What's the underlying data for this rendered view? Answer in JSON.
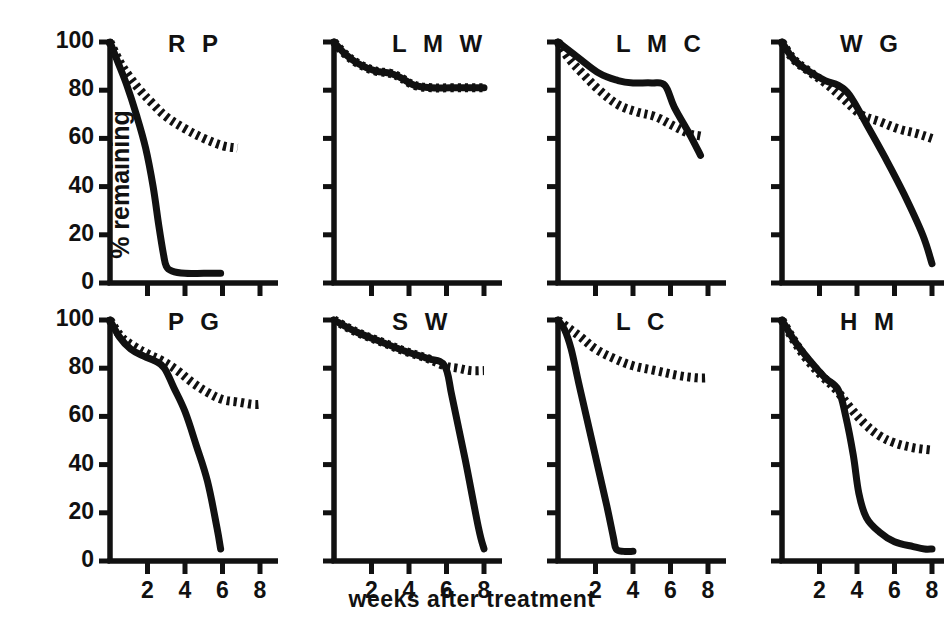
{
  "figure": {
    "ylabel": "% remaining",
    "xlabel": "weeks after treatment",
    "line_color": "#111111",
    "background": "#ffffff"
  },
  "axes": {
    "y_ticks": [
      "0",
      "20",
      "40",
      "60",
      "80",
      "100"
    ],
    "y_tick_values": [
      0,
      20,
      40,
      60,
      80,
      100
    ],
    "x_ticks": [
      "2",
      "4",
      "6",
      "8"
    ],
    "x_tick_values": [
      2,
      4,
      6,
      8
    ],
    "ylim": [
      0,
      100
    ],
    "xlim": [
      0,
      8
    ]
  },
  "chart_data": {
    "type": "line",
    "title": "",
    "xlabel": "weeks after treatment",
    "ylabel": "% remaining",
    "xlim": [
      0,
      8
    ],
    "ylim": [
      0,
      100
    ],
    "grid": false,
    "legend": "none",
    "layout": {
      "rows": 2,
      "cols": 4
    },
    "series_styles": [
      {
        "name": "solid",
        "style": "solid"
      },
      {
        "name": "hatched",
        "style": "dashed-hatched"
      }
    ],
    "panels": [
      {
        "label": "R P",
        "row": 0,
        "col": 0,
        "series": [
          {
            "name": "solid",
            "style": "solid",
            "x": [
              0,
              0.4,
              0.9,
              1.4,
              1.9,
              2.3,
              2.6,
              2.85,
              3.0,
              3.3,
              4.0,
              5.0,
              5.9
            ],
            "y": [
              100,
              92,
              82,
              70,
              56,
              40,
              24,
              12,
              7,
              5,
              4,
              4,
              4
            ]
          },
          {
            "name": "hatched",
            "style": "dashed-hatched",
            "x": [
              0,
              0.5,
              1.0,
              1.6,
              2.2,
              3.0,
              4.0,
              5.0,
              6.0,
              6.8
            ],
            "y": [
              100,
              92,
              86,
              80,
              75,
              69,
              64,
              60,
              57,
              56
            ]
          }
        ]
      },
      {
        "label": "L M W",
        "row": 0,
        "col": 1,
        "series": [
          {
            "name": "solid",
            "style": "solid",
            "x": [
              0,
              0.6,
              1.3,
              2.2,
              3.0,
              3.6,
              4.3,
              5.2,
              6.2,
              7.2,
              8.0
            ],
            "y": [
              100,
              95,
              91,
              88,
              87,
              85,
              82,
              81,
              81,
              81,
              81
            ]
          },
          {
            "name": "hatched",
            "style": "dashed-hatched",
            "x": [
              0,
              0.6,
              1.3,
              2.2,
              3.0,
              3.6,
              4.3,
              5.2,
              6.2,
              7.2,
              8.0
            ],
            "y": [
              100,
              95,
              91,
              88,
              87,
              85,
              82,
              81,
              81,
              81,
              81
            ]
          }
        ]
      },
      {
        "label": "L M C",
        "row": 0,
        "col": 2,
        "series": [
          {
            "name": "solid",
            "style": "solid",
            "x": [
              0,
              1.0,
              2.2,
              3.2,
              4.0,
              5.0,
              5.7,
              6.2,
              7.0,
              7.6
            ],
            "y": [
              100,
              94,
              87,
              84,
              83,
              83,
              82,
              73,
              62,
              53
            ]
          },
          {
            "name": "hatched",
            "style": "dashed-hatched",
            "x": [
              0,
              0.6,
              1.3,
              2.2,
              3.2,
              4.2,
              5.2,
              6.2,
              7.0,
              7.6
            ],
            "y": [
              100,
              93,
              87,
              80,
              74,
              71,
              69,
              65,
              62,
              61
            ]
          }
        ]
      },
      {
        "label": "W G",
        "row": 0,
        "col": 3,
        "series": [
          {
            "name": "solid",
            "style": "solid",
            "x": [
              0,
              0.6,
              1.4,
              2.3,
              3.0,
              3.6,
              4.5,
              5.5,
              6.5,
              7.5,
              8.0
            ],
            "y": [
              100,
              93,
              88,
              84,
              82,
              78,
              66,
              52,
              37,
              20,
              8
            ]
          },
          {
            "name": "hatched",
            "style": "dashed-hatched",
            "x": [
              0,
              0.6,
              1.4,
              2.3,
              3.2,
              4.2,
              5.2,
              6.2,
              7.2,
              8.0
            ],
            "y": [
              100,
              93,
              88,
              83,
              77,
              70,
              67,
              64,
              62,
              60
            ]
          }
        ]
      },
      {
        "label": "P G",
        "row": 1,
        "col": 0,
        "series": [
          {
            "name": "solid",
            "style": "solid",
            "x": [
              0,
              0.5,
              1.1,
              1.8,
              2.4,
              2.9,
              3.4,
              4.0,
              4.6,
              5.2,
              5.7,
              5.9
            ],
            "y": [
              100,
              93,
              88,
              85,
              83,
              80,
              72,
              62,
              48,
              33,
              14,
              5
            ]
          },
          {
            "name": "hatched",
            "style": "dashed-hatched",
            "x": [
              0,
              0.6,
              1.3,
              2.0,
              2.8,
              3.6,
              4.4,
              5.2,
              6.0,
              6.8,
              7.6,
              8.0
            ],
            "y": [
              100,
              93,
              89,
              86,
              83,
              79,
              74,
              70,
              67,
              66,
              65,
              65
            ]
          }
        ]
      },
      {
        "label": "S W",
        "row": 1,
        "col": 1,
        "series": [
          {
            "name": "solid",
            "style": "solid",
            "x": [
              0,
              1.2,
              2.5,
              3.8,
              5.0,
              5.9,
              6.3,
              7.0,
              7.7,
              8.0
            ],
            "y": [
              100,
              95,
              91,
              87,
              84,
              81,
              68,
              42,
              14,
              5
            ]
          },
          {
            "name": "hatched",
            "style": "dashed-hatched",
            "x": [
              0,
              1.2,
              2.5,
              3.8,
              5.0,
              5.9,
              6.6,
              7.3,
              8.0
            ],
            "y": [
              100,
              95,
              91,
              87,
              84,
              81,
              80,
              79,
              79
            ]
          }
        ]
      },
      {
        "label": "L C",
        "row": 1,
        "col": 2,
        "series": [
          {
            "name": "solid",
            "style": "solid",
            "x": [
              0,
              0.35,
              0.7,
              1.1,
              1.6,
              2.1,
              2.6,
              2.95,
              3.1,
              3.5,
              4.0
            ],
            "y": [
              100,
              96,
              88,
              74,
              57,
              40,
              23,
              10,
              5,
              4,
              4
            ]
          },
          {
            "name": "hatched",
            "style": "dashed-hatched",
            "x": [
              0,
              0.5,
              1.2,
              2.0,
              3.0,
              4.0,
              5.2,
              6.4,
              7.4,
              8.0
            ],
            "y": [
              100,
              97,
              93,
              88,
              84,
              81,
              79,
              77,
              76,
              76
            ]
          }
        ]
      },
      {
        "label": "H M",
        "row": 1,
        "col": 3,
        "series": [
          {
            "name": "solid",
            "style": "solid",
            "x": [
              0,
              0.7,
              1.5,
              2.3,
              3.0,
              3.4,
              3.8,
              4.1,
              4.5,
              5.2,
              6.0,
              7.0,
              7.6,
              8.0
            ],
            "y": [
              100,
              91,
              83,
              76,
              71,
              60,
              44,
              28,
              18,
              12,
              8,
              6,
              5,
              5
            ]
          },
          {
            "name": "hatched",
            "style": "dashed-hatched",
            "x": [
              0,
              0.6,
              1.3,
              2.1,
              2.9,
              3.6,
              4.4,
              5.2,
              6.0,
              7.0,
              8.0
            ],
            "y": [
              100,
              92,
              84,
              77,
              71,
              64,
              57,
              52,
              49,
              47,
              46
            ]
          }
        ]
      }
    ]
  }
}
